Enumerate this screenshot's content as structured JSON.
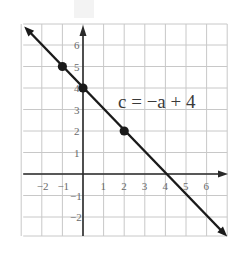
{
  "chart_data": {
    "type": "line",
    "title": "",
    "equation": "c = −a + 4",
    "xlabel": "a",
    "ylabel": "c",
    "xlim": [
      -3,
      7
    ],
    "ylim": [
      -3,
      7
    ],
    "grid": true,
    "x_ticks": [
      "−2",
      "−1",
      "1",
      "2",
      "3",
      "4",
      "5",
      "6"
    ],
    "x_tick_values": [
      -2,
      -1,
      1,
      2,
      3,
      4,
      5,
      6
    ],
    "y_ticks": [
      "6",
      "5",
      "4",
      "3",
      "2",
      "1",
      "−1",
      "−2"
    ],
    "y_tick_values": [
      6,
      5,
      4,
      3,
      2,
      1,
      -1,
      -2
    ],
    "series": [
      {
        "name": "c = −a + 4",
        "slope": -1,
        "intercept": 4,
        "line_start": [
          -3,
          7
        ],
        "line_end": [
          7,
          -3
        ],
        "points": [
          {
            "a": -1,
            "c": 5
          },
          {
            "a": 0,
            "c": 4
          },
          {
            "a": 2,
            "c": 2
          }
        ]
      }
    ],
    "colors": {
      "line": "#1a1a1a",
      "grid": "#c8c8c8",
      "axis": "#2a2a2a",
      "tick_text": "#6a6a6a"
    }
  }
}
